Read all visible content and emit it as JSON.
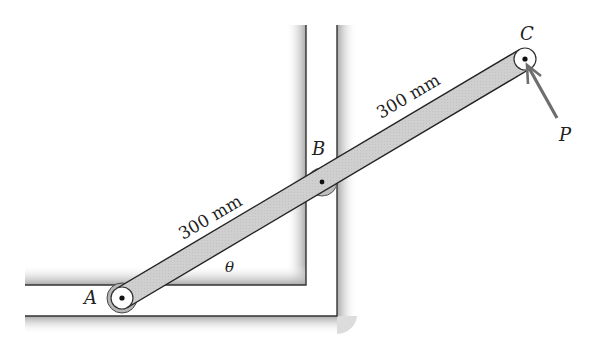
{
  "figure": {
    "type": "mechanism-diagram",
    "points": {
      "A": {
        "label": "A"
      },
      "B": {
        "label": "B"
      },
      "C": {
        "label": "C"
      }
    },
    "force": {
      "label": "P"
    },
    "angle": {
      "label": "θ"
    },
    "dimensions": [
      {
        "name": "AB",
        "label": "300 mm"
      },
      {
        "name": "BC",
        "label": "300 mm"
      }
    ],
    "colors": {
      "bar_fill": "#cfcfcf",
      "wall_shade": "#b5b5b5",
      "line": "#222222",
      "force_arrow": "#6e6e6e"
    }
  }
}
